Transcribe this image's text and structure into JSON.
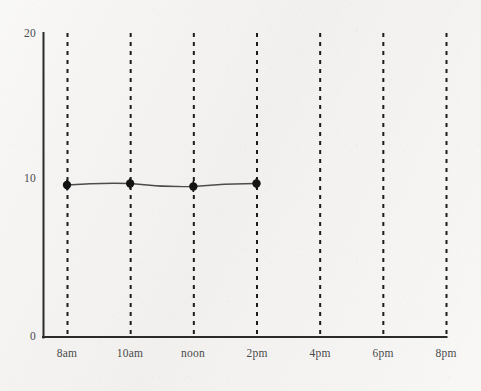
{
  "chart_data": {
    "type": "line",
    "title": "",
    "subtitle": "",
    "xlabel": "",
    "ylabel": "",
    "x_tick_labels": [
      "8am",
      "10am",
      "noon",
      "2pm",
      "4pm",
      "6pm",
      "8pm"
    ],
    "y_tick_labels": [
      "0",
      "10",
      "20"
    ],
    "y_tick_values": [
      0,
      10,
      20
    ],
    "ylim": [
      0,
      20
    ],
    "xlim_labels": [
      "8am",
      "8pm"
    ],
    "grid": {
      "vertical": true,
      "horizontal": false,
      "style": "dashed",
      "color": "#1c1c1c"
    },
    "legend": {
      "visible": false,
      "position": "none"
    },
    "categories": [
      "8am",
      "10am",
      "noon",
      "2pm"
    ],
    "values": [
      10,
      10.1,
      9.9,
      10.1
    ],
    "series": [
      {
        "name": "series-1",
        "x": [
          "8am",
          "10am",
          "noon",
          "2pm"
        ],
        "values": [
          10,
          10.1,
          9.9,
          10.1
        ],
        "line_color": "#4c4c4c",
        "marker": "circle",
        "marker_color": "#141414"
      }
    ],
    "annotations": [],
    "axis_color": "#2b2b2b",
    "background_color": "#f3f2f0"
  },
  "axes": {
    "y_axis_name": "y-axis",
    "x_axis_name": "x-axis"
  }
}
